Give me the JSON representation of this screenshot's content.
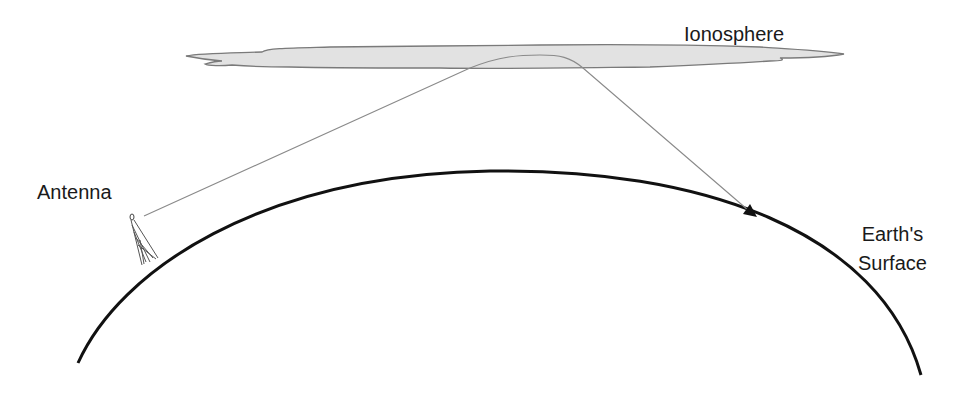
{
  "diagram": {
    "type": "skywave-propagation",
    "labels": {
      "ionosphere": "Ionosphere",
      "antenna": "Antenna",
      "earth_line1": "Earth's",
      "earth_line2": "Surface"
    },
    "colors": {
      "background": "#ffffff",
      "ionosphere_fill": "#e2e2e2",
      "ionosphere_stroke": "#7a7a7a",
      "ray": "#8a8a8a",
      "earth_surface": "#111111",
      "text": "#1a1a1a"
    },
    "elements": [
      {
        "id": "ionosphere",
        "kind": "cloud-band"
      },
      {
        "id": "earth-surface",
        "kind": "arc"
      },
      {
        "id": "antenna",
        "kind": "tower"
      },
      {
        "id": "radio-ray",
        "kind": "refracted-path"
      },
      {
        "id": "receive-point",
        "kind": "arrowhead"
      }
    ]
  }
}
